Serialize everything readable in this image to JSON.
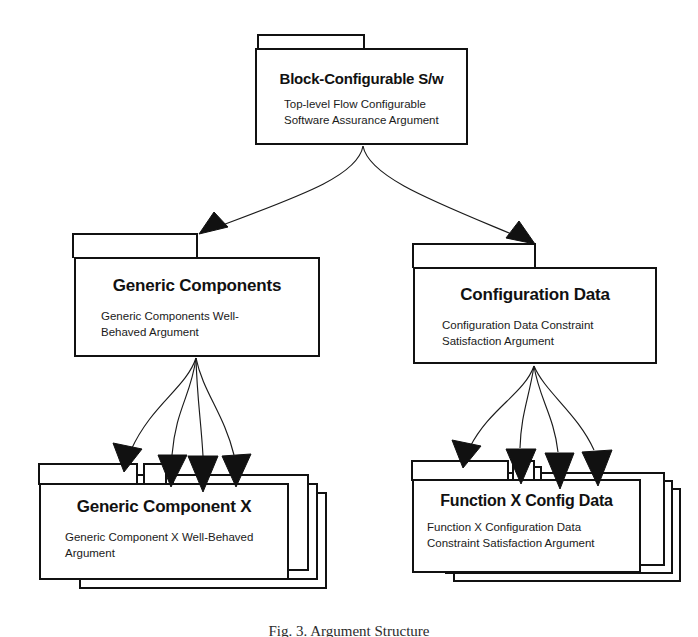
{
  "diagram": {
    "type": "uml-package-diagram",
    "background": "#ffffff",
    "line_color": "#111111",
    "text_color": "#111111"
  },
  "nodes": {
    "root": {
      "title": "Block-Configurable S/w",
      "subtitle": "Top-level Flow Configurable\nSoftware Assurance Argument",
      "stacked": false
    },
    "generic_components": {
      "title": "Generic Components",
      "subtitle": "Generic Components Well-\nBehaved Argument",
      "stacked": false
    },
    "configuration_data": {
      "title": "Configuration Data",
      "subtitle": "Configuration Data Constraint\nSatisfaction Argument",
      "stacked": false
    },
    "generic_component_x": {
      "title": "Generic Component X",
      "subtitle": "Generic Component X Well-Behaved\nArgument",
      "stacked": true,
      "stack_count": 3
    },
    "function_x_config_data": {
      "title": "Function X Config Data",
      "subtitle": "Function X Configuration Data\nConstraint Satisfaction Argument",
      "stacked": true,
      "stack_count": 3
    }
  },
  "edges": [
    {
      "from": "root",
      "to": "generic_components",
      "style": "curved-solid-arrow"
    },
    {
      "from": "root",
      "to": "configuration_data",
      "style": "curved-solid-arrow"
    },
    {
      "from": "generic_components",
      "to": "generic_component_x",
      "style": "curved-solid-arrow-fan",
      "count": 4
    },
    {
      "from": "configuration_data",
      "to": "function_x_config_data",
      "style": "curved-solid-arrow-fan",
      "count": 4
    }
  ],
  "caption": {
    "text": "Fig. 3.  Argument Structure"
  }
}
